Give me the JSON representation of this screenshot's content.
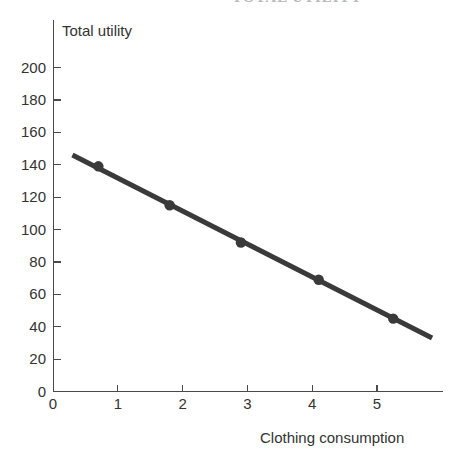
{
  "figure": {
    "cut_off_title": "TOTAL UTILITY",
    "y_axis_title": "Total utility",
    "x_axis_title": "Clothing consumption"
  },
  "chart_data": {
    "type": "line",
    "title": "",
    "xlabel": "Clothing consumption",
    "ylabel": "Total utility",
    "xlim": [
      0,
      6
    ],
    "ylim": [
      0,
      210
    ],
    "grid": false,
    "legend": null,
    "x_ticks": [
      "0",
      "1",
      "2",
      "3",
      "4",
      "5"
    ],
    "x_tick_values": [
      0,
      1,
      2,
      3,
      4,
      5
    ],
    "y_ticks": [
      "0",
      "20",
      "40",
      "60",
      "80",
      "100",
      "120",
      "140",
      "160",
      "180",
      "200"
    ],
    "y_tick_values": [
      0,
      20,
      40,
      60,
      80,
      100,
      120,
      140,
      160,
      180,
      200
    ],
    "series": [
      {
        "name": "Total utility",
        "color": "#3a3a3a",
        "line_width": 5,
        "marker": "circle",
        "x": [
          0.7,
          1.8,
          2.9,
          4.1,
          5.25
        ],
        "y": [
          139,
          115,
          92,
          69,
          45
        ],
        "line_segment": {
          "x0": 0.3,
          "y0": 146,
          "x1": 5.85,
          "y1": 33
        }
      }
    ]
  }
}
